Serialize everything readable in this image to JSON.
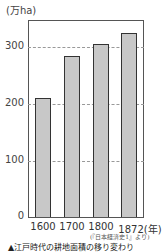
{
  "chart_data": {
    "type": "bar",
    "title": "",
    "xlabel": "",
    "ylabel": "(万ha)",
    "categories": [
      "1600",
      "1700",
      "1800",
      "1872(年)"
    ],
    "values": [
      208,
      282,
      303,
      323
    ],
    "ylim": [
      0,
      340
    ],
    "yticks": [
      "0",
      "100",
      "200",
      "300"
    ],
    "grid": true,
    "legend": null,
    "source": "(『日本経済史1』より)",
    "caption": "▲江戸時代の耕地面積の移り変わり",
    "bar_color": "#c8c8c8"
  }
}
